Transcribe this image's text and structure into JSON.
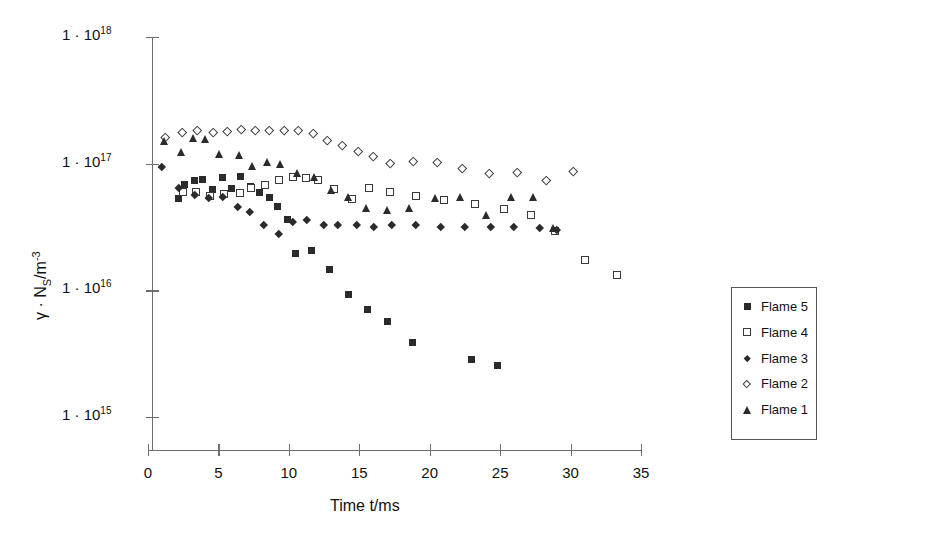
{
  "chart_data": {
    "type": "scatter",
    "title": "",
    "xlabel": "Time t/ms",
    "ylabel": "γ · N",
    "ylabel_sub": "S",
    "ylabel_unit": "/m",
    "ylabel_exp": "-3",
    "xlim": [
      0,
      35
    ],
    "ylim_log": [
      1000000000000000.0,
      1e+18
    ],
    "xticks": [
      0,
      5,
      10,
      15,
      20,
      25,
      30,
      35
    ],
    "xtick_labels": [
      "0",
      "5",
      "10",
      "15",
      "20",
      "25",
      "30",
      "35"
    ],
    "yticks_exp": [
      18,
      17,
      16,
      15
    ],
    "ytick_labels": [
      "1 · 10",
      "1 · 10",
      "1 · 10",
      "1 · 10"
    ],
    "ytick_exponents": [
      "18",
      "17",
      "16",
      "15"
    ],
    "grid": false,
    "legend_position": "inside-lower-right",
    "series": [
      {
        "name": "Flame 5",
        "marker": "filled-square",
        "color": "#2b2b2b",
        "points": [
          [
            2.2,
            5.3e+16
          ],
          [
            2.6,
            6.9e+16
          ],
          [
            3.3,
            7.4e+16
          ],
          [
            3.9,
            7.5e+16
          ],
          [
            4.6,
            6.3e+16
          ],
          [
            5.3,
            7.8e+16
          ],
          [
            5.9,
            6.4e+16
          ],
          [
            6.6,
            7.9e+16
          ],
          [
            7.3,
            6.6e+16
          ],
          [
            7.9,
            5.9e+16
          ],
          [
            8.6,
            5.4e+16
          ],
          [
            9.2,
            4.6e+16
          ],
          [
            9.9,
            3.6e+16
          ],
          [
            10.5,
            1.95e+16
          ],
          [
            11.6,
            2.05e+16
          ],
          [
            12.9,
            1.45e+16
          ],
          [
            14.2,
            9200000000000000.0
          ],
          [
            15.6,
            7000000000000000.0
          ],
          [
            17.0,
            5700000000000000.0
          ],
          [
            18.8,
            3900000000000000.0
          ],
          [
            23.0,
            2850000000000000.0
          ],
          [
            24.8,
            2550000000000000.0
          ]
        ]
      },
      {
        "name": "Flame 4",
        "marker": "open-square",
        "color": "#3a3a3a",
        "points": [
          [
            2.5,
            6e+16
          ],
          [
            3.4,
            6e+16
          ],
          [
            4.4,
            5.6e+16
          ],
          [
            5.4,
            5.8e+16
          ],
          [
            6.5,
            5.9e+16
          ],
          [
            7.3,
            6.4e+16
          ],
          [
            8.3,
            6.8e+16
          ],
          [
            9.3,
            7.4e+16
          ],
          [
            10.3,
            7.8e+16
          ],
          [
            11.2,
            7.7e+16
          ],
          [
            12.1,
            7.4e+16
          ],
          [
            13.2,
            6.3e+16
          ],
          [
            14.5,
            5.3e+16
          ],
          [
            15.7,
            6.4e+16
          ],
          [
            17.2,
            6e+16
          ],
          [
            19.0,
            5.6e+16
          ],
          [
            21.0,
            5.2e+16
          ],
          [
            23.2,
            4.8e+16
          ],
          [
            25.3,
            4.4e+16
          ],
          [
            27.2,
            3.9e+16
          ],
          [
            28.9,
            2.95e+16
          ],
          [
            31.0,
            1.72e+16
          ],
          [
            33.3,
            1.32e+16
          ]
        ]
      },
      {
        "name": "Flame 3",
        "marker": "filled-diamond",
        "color": "#2b2b2b",
        "points": [
          [
            1.0,
            9.4e+16
          ],
          [
            2.2,
            6.4e+16
          ],
          [
            3.3,
            5.7e+16
          ],
          [
            4.3,
            5.4e+16
          ],
          [
            5.3,
            5.5e+16
          ],
          [
            6.4,
            4.6e+16
          ],
          [
            7.2,
            4.2e+16
          ],
          [
            8.2,
            3.3e+16
          ],
          [
            9.3,
            2.8e+16
          ],
          [
            10.3,
            3.5e+16
          ],
          [
            11.3,
            3.6e+16
          ],
          [
            12.5,
            3.3e+16
          ],
          [
            13.5,
            3.3e+16
          ],
          [
            14.8,
            3.3e+16
          ],
          [
            16.0,
            3.2e+16
          ],
          [
            17.3,
            3.3e+16
          ],
          [
            19.0,
            3.3e+16
          ],
          [
            20.8,
            3.2e+16
          ],
          [
            22.5,
            3.2e+16
          ],
          [
            24.3,
            3.2e+16
          ],
          [
            26.0,
            3.2e+16
          ],
          [
            27.8,
            3.1e+16
          ],
          [
            29.0,
            3e+16
          ]
        ]
      },
      {
        "name": "Flame 2",
        "marker": "open-diamond",
        "color": "#3a3a3a",
        "points": [
          [
            1.2,
            1.62e+17
          ],
          [
            2.4,
            1.78e+17
          ],
          [
            3.5,
            1.82e+17
          ],
          [
            4.6,
            1.78e+17
          ],
          [
            5.6,
            1.8e+17
          ],
          [
            6.6,
            1.88e+17
          ],
          [
            7.6,
            1.85e+17
          ],
          [
            8.6,
            1.84e+17
          ],
          [
            9.7,
            1.84e+17
          ],
          [
            10.7,
            1.84e+17
          ],
          [
            11.7,
            1.74e+17
          ],
          [
            12.7,
            1.52e+17
          ],
          [
            13.8,
            1.4e+17
          ],
          [
            14.9,
            1.26e+17
          ],
          [
            16.0,
            1.15e+17
          ],
          [
            17.2,
            1e+17
          ],
          [
            18.8,
            1.04e+17
          ],
          [
            20.5,
            1.02e+17
          ],
          [
            22.3,
            9.2e+16
          ],
          [
            24.2,
            8.4e+16
          ],
          [
            26.2,
            8.5e+16
          ],
          [
            28.3,
            7.4e+16
          ],
          [
            30.2,
            8.7e+16
          ]
        ]
      },
      {
        "name": "Flame 1",
        "marker": "filled-triangle",
        "color": "#2b2b2b",
        "points": [
          [
            1.2,
            1.52e+17
          ],
          [
            2.4,
            1.23e+17
          ],
          [
            3.2,
            1.59e+17
          ],
          [
            4.1,
            1.58e+17
          ],
          [
            5.1,
            1.2e+17
          ],
          [
            6.5,
            1.18e+17
          ],
          [
            7.4,
            9.6e+16
          ],
          [
            8.5,
            1.04e+17
          ],
          [
            9.4,
            9.9e+16
          ],
          [
            10.6,
            8.4e+16
          ],
          [
            11.8,
            7.9e+16
          ],
          [
            13.0,
            6.2e+16
          ],
          [
            14.2,
            5.5e+16
          ],
          [
            15.5,
            4.5e+16
          ],
          [
            17.0,
            4.3e+16
          ],
          [
            18.6,
            4.5e+16
          ],
          [
            20.4,
            5.4e+16
          ],
          [
            22.2,
            5.5e+16
          ],
          [
            24.0,
            3.9e+16
          ],
          [
            25.8,
            5.5e+16
          ],
          [
            27.4,
            5.5e+16
          ],
          [
            28.8,
            3.1e+16
          ]
        ]
      }
    ],
    "legend": [
      {
        "label": "Flame 5",
        "marker": "filled-square"
      },
      {
        "label": "Flame 4",
        "marker": "open-square"
      },
      {
        "label": "Flame 3",
        "marker": "filled-diamond"
      },
      {
        "label": "Flame 2",
        "marker": "open-diamond"
      },
      {
        "label": "Flame 1",
        "marker": "filled-triangle"
      }
    ]
  }
}
